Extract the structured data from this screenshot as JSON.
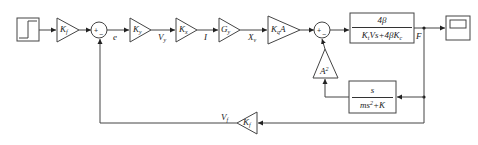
{
  "diagram": {
    "type": "block-diagram",
    "blocks": {
      "step_source": {
        "icon": "step-signal-icon"
      },
      "gain_kf_in": {
        "symbol": "K",
        "sub": "f"
      },
      "gain_ky": {
        "symbol": "K",
        "sub": "y"
      },
      "gain_kx": {
        "symbol": "K",
        "sub": "x"
      },
      "gain_gy": {
        "symbol": "G",
        "sub": "y"
      },
      "gain_kqa": {
        "symbol": "K",
        "sub": "q",
        "suffix": "A"
      },
      "gain_a2": {
        "symbol": "A",
        "sup": "2"
      },
      "gain_kf_fb": {
        "symbol": "K",
        "sub": "f"
      },
      "tf_main": {
        "numerator": "4β",
        "den_parts": [
          "K",
          "t",
          "Vs+4βK",
          "c"
        ]
      },
      "tf_feedback": {
        "numerator": "s",
        "den_parts": [
          "ms",
          "2",
          "+K"
        ]
      },
      "scope": {
        "icon": "scope-icon"
      }
    },
    "summers": {
      "sum1": {
        "plus": "+",
        "minus": "−"
      },
      "sum2": {
        "plus": "+",
        "minus": "−"
      }
    },
    "signals": {
      "e": "e",
      "vy": {
        "symbol": "V",
        "sub": "y"
      },
      "i": "I",
      "xv": {
        "symbol": "X",
        "sub": "v"
      },
      "f": "F",
      "vf": {
        "symbol": "V",
        "sub": "f"
      }
    }
  }
}
